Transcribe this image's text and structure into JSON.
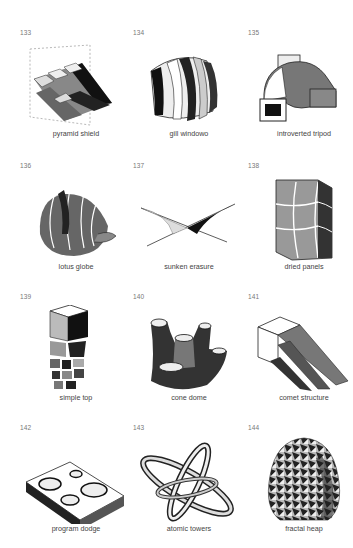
{
  "catalog": {
    "items": [
      {
        "number": "133",
        "caption": "pyramid shield"
      },
      {
        "number": "134",
        "caption": "gill windowo"
      },
      {
        "number": "135",
        "caption": "introverted tripod"
      },
      {
        "number": "136",
        "caption": "lotus globe"
      },
      {
        "number": "137",
        "caption": "sunken erasure"
      },
      {
        "number": "138",
        "caption": "dried panels"
      },
      {
        "number": "139",
        "caption": "simple top"
      },
      {
        "number": "140",
        "caption": "cone dome"
      },
      {
        "number": "141",
        "caption": "comet structure"
      },
      {
        "number": "142",
        "caption": "program dodge"
      },
      {
        "number": "143",
        "caption": "atomic towers"
      },
      {
        "number": "144",
        "caption": "fractal heap"
      }
    ]
  }
}
